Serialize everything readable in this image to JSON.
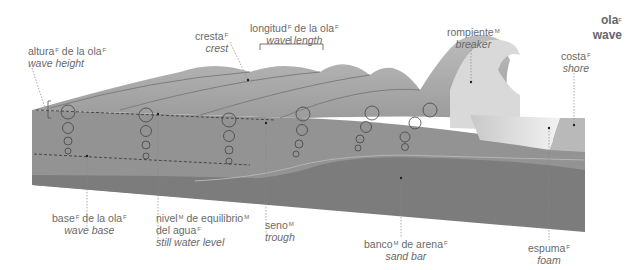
{
  "title": {
    "es": "ola",
    "es_gender": "F",
    "en": "wave"
  },
  "labels": {
    "wave_height": {
      "es_parts": [
        [
          "altura",
          "F"
        ],
        [
          " de la ola",
          "F"
        ]
      ],
      "es": "altura de la ola",
      "en": "wave height"
    },
    "crest": {
      "es": "cresta",
      "gender": "F",
      "en": "crest"
    },
    "wave_length": {
      "es": "longitud de la ola",
      "en": "wave length"
    },
    "breaker": {
      "es": "rompiente",
      "gender": "M",
      "en": "breaker"
    },
    "shore": {
      "es": "costa",
      "gender": "F",
      "en": "shore"
    },
    "wave_base": {
      "es": "base de la ola",
      "en": "wave base"
    },
    "still_water_level": {
      "es_line1": "nivel de equilibrio",
      "es_line2": "del agua",
      "en": "still water level"
    },
    "trough": {
      "es": "seno",
      "gender": "M",
      "en": "trough"
    },
    "sand_bar": {
      "es": "banco de arena",
      "en": "sand bar"
    },
    "foam": {
      "es": "espuma",
      "gender": "F",
      "en": "foam"
    }
  },
  "colors": {
    "water_front": "#8e8e8e",
    "water_top": "#a9a9a9",
    "seabed": "#7a7a7a",
    "foam": "#e6e6e6",
    "leader": "#777777",
    "text": "#6a6a6a"
  }
}
